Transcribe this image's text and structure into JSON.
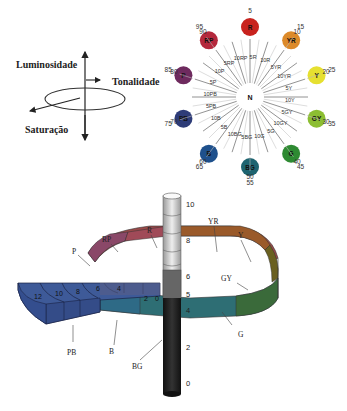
{
  "axes_diagram": {
    "luminosity_label": "Luminosidade",
    "hue_label": "Tonalidade",
    "saturation_label": "Saturação"
  },
  "hue_wheel": {
    "center_label": "N",
    "principal_hues": [
      {
        "code": "R",
        "number": "5",
        "color": "#c8231e"
      },
      {
        "code": "YR",
        "number": "15",
        "color": "#dc8a2a"
      },
      {
        "code": "Y",
        "number": "25",
        "color": "#e6e030"
      },
      {
        "code": "GY",
        "number": "35",
        "color": "#8cbe32"
      },
      {
        "code": "G",
        "number": "45",
        "color": "#2e8a32"
      },
      {
        "code": "BG",
        "number": "55",
        "color": "#1e6470"
      },
      {
        "code": "B",
        "number": "65",
        "color": "#1e508c"
      },
      {
        "code": "PB",
        "number": "75",
        "color": "#2e3c78"
      },
      {
        "code": "P",
        "number": "85",
        "color": "#6e2a5e"
      },
      {
        "code": "RP",
        "number": "95",
        "color": "#b4283c"
      }
    ],
    "intermediate_numbers": [
      "10",
      "20",
      "30",
      "40",
      "50",
      "60",
      "70",
      "80",
      "90"
    ],
    "spoke_labels": [
      "5R",
      "10R",
      "5YR",
      "10YR",
      "5Y",
      "10Y",
      "5GY",
      "10GY",
      "5G",
      "10G",
      "5BG",
      "10BG",
      "5B",
      "10B",
      "5PB",
      "10PB",
      "5P",
      "10P",
      "5RP",
      "10RP"
    ]
  },
  "solid": {
    "value_scale": [
      "10",
      "8",
      "6",
      "5",
      "4",
      "2",
      "0"
    ],
    "chroma_scale": [
      "12",
      "10",
      "8",
      "6",
      "4",
      "2",
      "0"
    ],
    "hue_labels": [
      "R",
      "YR",
      "Y",
      "GY",
      "G",
      "BG",
      "B",
      "PB",
      "P",
      "RP"
    ]
  },
  "caption": "Sistema de cores de Munsell"
}
